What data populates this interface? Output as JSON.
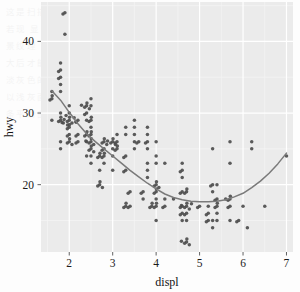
{
  "figure": {
    "panel": {
      "background_color": "#ebebeb",
      "gridline_major_color": "#ffffff",
      "gridline_minor_color": "#f5f5f5",
      "left": 41,
      "top": 2,
      "right": 293,
      "bottom": 252
    },
    "point_color": "#4d4d4d",
    "smooth_line_color": "#7a7a7a"
  },
  "axes": {
    "x": {
      "title": "displ",
      "ticks": [
        2,
        3,
        4,
        5,
        6,
        7
      ],
      "tick_labels": [
        "2",
        "3",
        "4",
        "5",
        "6",
        "7"
      ],
      "limits": [
        1.35,
        7.15
      ]
    },
    "y": {
      "title": "hwy",
      "ticks": [
        20,
        30,
        40
      ],
      "tick_labels": [
        "20",
        "30",
        "40"
      ],
      "limits": [
        10.6,
        45.5
      ]
    }
  },
  "chart_data": {
    "type": "scatter",
    "title": "",
    "xlabel": "displ",
    "ylabel": "hwy",
    "xlim": [
      1.35,
      7.15
    ],
    "ylim": [
      10.6,
      45.5
    ],
    "grid": true,
    "legend": "none",
    "series": [
      {
        "name": "mpg observations",
        "marker": "circle",
        "color": "#4d4d4d",
        "x": [
          1.8,
          1.8,
          2.0,
          2.0,
          2.8,
          2.8,
          3.1,
          1.8,
          1.8,
          2.0,
          2.0,
          2.8,
          2.8,
          3.1,
          3.1,
          2.8,
          3.1,
          4.2,
          5.3,
          5.3,
          5.3,
          5.7,
          6.0,
          5.7,
          5.7,
          6.2,
          6.2,
          7.0,
          5.3,
          5.3,
          5.7,
          6.5,
          2.4,
          2.4,
          3.1,
          3.5,
          3.6,
          2.4,
          3.0,
          3.3,
          3.3,
          3.3,
          3.3,
          3.3,
          3.8,
          3.8,
          3.8,
          4.0,
          3.7,
          3.7,
          3.9,
          3.9,
          4.7,
          4.7,
          4.7,
          5.2,
          5.2,
          3.9,
          4.7,
          4.7,
          4.7,
          5.2,
          5.7,
          5.9,
          4.7,
          4.7,
          4.7,
          4.7,
          4.7,
          4.7,
          5.2,
          5.2,
          5.7,
          5.9,
          4.6,
          5.4,
          5.4,
          4.0,
          4.0,
          4.0,
          4.0,
          4.6,
          5.0,
          4.2,
          4.2,
          4.6,
          4.6,
          4.6,
          5.4,
          5.4,
          3.8,
          3.8,
          4.0,
          4.0,
          4.6,
          4.6,
          4.6,
          4.6,
          5.4,
          1.6,
          1.6,
          1.6,
          1.6,
          1.6,
          1.8,
          1.8,
          1.8,
          2.0,
          2.4,
          2.4,
          2.4,
          2.4,
          2.5,
          2.5,
          3.3,
          2.0,
          2.0,
          2.0,
          2.0,
          2.7,
          2.7,
          2.7,
          3.0,
          3.7,
          4.0,
          4.7,
          4.7,
          4.7,
          5.7,
          6.1,
          4.0,
          4.2,
          4.4,
          4.6,
          5.4,
          5.4,
          5.4,
          4.0,
          4.0,
          4.6,
          5.0,
          2.4,
          2.4,
          2.5,
          2.5,
          3.5,
          3.5,
          3.0,
          3.0,
          3.5,
          3.3,
          3.3,
          4.0,
          5.6,
          3.1,
          3.8,
          3.8,
          3.8,
          5.3,
          2.5,
          2.5,
          2.5,
          2.5,
          2.5,
          2.5,
          2.2,
          2.2,
          2.5,
          2.5,
          2.5,
          2.5,
          2.5,
          2.5,
          2.7,
          2.7,
          3.4,
          3.4,
          4.0,
          4.7,
          2.2,
          2.2,
          2.4,
          2.4,
          3.0,
          3.0,
          3.5,
          2.2,
          2.2,
          2.4,
          2.4,
          3.0,
          3.0,
          3.3,
          1.8,
          1.8,
          1.8,
          1.8,
          1.8,
          4.7,
          5.7,
          2.7,
          2.7,
          2.7,
          3.4,
          3.4,
          4.0,
          4.0,
          2.0,
          2.0,
          2.0,
          2.0,
          2.8,
          1.9,
          2.0,
          2.0,
          2.0,
          2.0,
          2.5,
          2.5,
          2.8,
          2.8,
          1.9,
          1.9,
          2.0,
          2.0,
          2.5,
          2.5,
          1.8,
          1.8,
          2.0,
          2.0,
          2.8,
          2.8,
          3.6
        ],
        "y": [
          29,
          29,
          31,
          30,
          26,
          26,
          27,
          26,
          25,
          28,
          27,
          25,
          25,
          25,
          25,
          24,
          25,
          23,
          20,
          15,
          20,
          17,
          17,
          26,
          23,
          26,
          25,
          24,
          19,
          14,
          15,
          17,
          27,
          30,
          26,
          29,
          26,
          24,
          24,
          22,
          22,
          24,
          24,
          17,
          22,
          21,
          23,
          23,
          19,
          18,
          17,
          17,
          19,
          19,
          12,
          17,
          15,
          17,
          17,
          12,
          17,
          16,
          18,
          15,
          16,
          12,
          17,
          17,
          16,
          12,
          15,
          16,
          17,
          15,
          17,
          17,
          18,
          17,
          19,
          17,
          19,
          19,
          17,
          17,
          17,
          16,
          16,
          17,
          15,
          17,
          26,
          25,
          26,
          24,
          21,
          22,
          23,
          22,
          20,
          33,
          32,
          32,
          29,
          32,
          34,
          36,
          36,
          29,
          26,
          27,
          30,
          31,
          26,
          26,
          28,
          26,
          29,
          28,
          27,
          24,
          24,
          24,
          22,
          19,
          20,
          17,
          12,
          19,
          18,
          14,
          15,
          18,
          18,
          15,
          17,
          16,
          18,
          17,
          19,
          19,
          17,
          29,
          27,
          31,
          32,
          27,
          26,
          26,
          25,
          25,
          17,
          17,
          20,
          18,
          26,
          26,
          27,
          28,
          25,
          25,
          24,
          27,
          25,
          26,
          23,
          26,
          26,
          26,
          26,
          25,
          27,
          25,
          27,
          20,
          20,
          19,
          17,
          20,
          17,
          29,
          27,
          31,
          31,
          26,
          26,
          28,
          27,
          29,
          31,
          31,
          26,
          26,
          27,
          30,
          33,
          35,
          37,
          35,
          15,
          18,
          20,
          20,
          22,
          17,
          19,
          18,
          20,
          29,
          26,
          29,
          29,
          24,
          44,
          29,
          26,
          29,
          29,
          29,
          29,
          23,
          24,
          44,
          41,
          29,
          26,
          28,
          29,
          29,
          29,
          28,
          29,
          26,
          26,
          26
        ]
      },
      {
        "name": "loess smooth",
        "marker": "line",
        "color": "#7a7a7a",
        "x": [
          1.6,
          1.8,
          2.0,
          2.2,
          2.4,
          2.6,
          2.8,
          3.0,
          3.2,
          3.4,
          3.6,
          3.8,
          4.0,
          4.2,
          4.4,
          4.6,
          4.8,
          5.0,
          5.2,
          5.4,
          5.6,
          5.8,
          6.0,
          6.2,
          6.4,
          6.6,
          6.8,
          7.0
        ],
        "y": [
          33.1,
          31.8,
          30.1,
          28.5,
          27.1,
          26.0,
          25.0,
          24.0,
          23.0,
          22.0,
          21.1,
          20.2,
          19.4,
          18.7,
          18.2,
          17.9,
          17.7,
          17.6,
          17.6,
          17.7,
          17.9,
          18.3,
          18.8,
          19.6,
          20.5,
          21.6,
          22.9,
          24.4
        ]
      }
    ]
  },
  "showthrough_text": "这是扫描页面背后透出的淡淡的文字内容 在图表区域后面若隐若现 显示出纸张的双面印刷效果 文本行距均匀排列 构成了背景纹理 而不是图表本身的数据部分 阅读时几乎不可见 仅在放大后才能察觉 这些笔画的痕迹 它们与网格线交织在一起 形成淡灰色的斑驳质感 属于扫描件的常见特征 并非绘图元素 图形以浅灰面板为底 白色网格线分隔刻度 深灰圆点表示观测值 一条平滑曲线贯穿其中"
}
